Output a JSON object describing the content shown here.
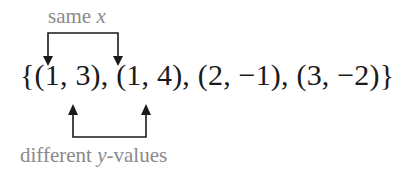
{
  "top_label": {
    "text": "same ",
    "var": "x"
  },
  "set_expression": "{(1, 3), (1, 4), (2, −1), (3, −2)}",
  "bottom_label": {
    "var": "y",
    "text": "-values",
    "prefix": "different "
  },
  "pairs": [
    {
      "x": 1,
      "y": 3
    },
    {
      "x": 1,
      "y": 4
    },
    {
      "x": 2,
      "y": -1
    },
    {
      "x": 3,
      "y": -2
    }
  ],
  "annotations": [
    {
      "label": "same x",
      "connects": [
        "(1, 3)",
        "(1, 4)"
      ],
      "direction": "down"
    },
    {
      "label": "different y-values",
      "connects": [
        "(1, 3)",
        "(1, 4)"
      ],
      "direction": "up"
    }
  ],
  "colors": {
    "label": "#8a8a8a",
    "set": "#1a1a1a",
    "arrow": "#1a1a1a"
  }
}
